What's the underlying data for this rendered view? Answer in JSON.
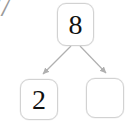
{
  "page": {
    "background_color": "#ffffff"
  },
  "corner_mark": {
    "name": "cropped-digit-7",
    "text": "7",
    "color": "#9a9a9a"
  },
  "diagram": {
    "type": "number-bond",
    "whole": {
      "label": "8",
      "name": "whole-box",
      "filled": true
    },
    "parts": [
      {
        "label": "2",
        "name": "part-box-left",
        "filled": true
      },
      {
        "label": "",
        "name": "part-box-right",
        "filled": false
      }
    ],
    "connectors": [
      {
        "name": "arrow-whole-to-left-part",
        "from": "whole",
        "to": "part-left",
        "arrowhead": true
      },
      {
        "name": "arrow-whole-to-right-part",
        "from": "whole",
        "to": "part-right",
        "arrowhead": true
      }
    ],
    "styles": {
      "box_border_color": "#d2d2d2",
      "box_fill_color": "#ffffff",
      "digit_color": "#111111",
      "connector_color": "#b0b0b0"
    }
  }
}
